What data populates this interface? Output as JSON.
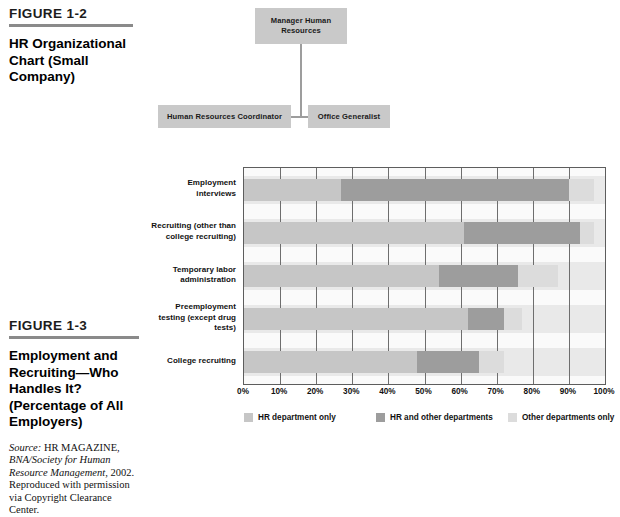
{
  "figure_1_2": {
    "label": "FIGURE 1-2",
    "title": "HR Organizational Chart (Small Company)",
    "org_chart": {
      "top": "Manager Human Resources",
      "left": "Human Resources Coordinator",
      "right": "Office Generalist"
    }
  },
  "figure_1_3": {
    "label": "FIGURE 1-3",
    "title": "Employment and Recruiting—Who Handles It? (Percentage of All Employers)",
    "source_prefix": "Source:",
    "source_body": " HR MAGAZINE, BNA/Society for Human Resource Management, 2002. Reproduced with permission via Copyright Clearance Center.",
    "source_italic_part": "BNA/Society for Human Resource Management",
    "chart_data": {
      "type": "bar",
      "orientation": "horizontal",
      "stacked": true,
      "title": "Employment and Recruiting—Who Handles It? (Percentage of All Employers)",
      "xlabel": "",
      "ylabel": "",
      "xlim": [
        0,
        100
      ],
      "grid": true,
      "legend_position": "bottom",
      "xticks": [
        "0%",
        "10%",
        "20%",
        "30%",
        "40%",
        "50%",
        "60%",
        "70%",
        "80%",
        "90%",
        "100%"
      ],
      "xtick_values": [
        0,
        10,
        20,
        30,
        40,
        50,
        60,
        70,
        80,
        90,
        100
      ],
      "categories": [
        "Employment interviews",
        "Recruiting (other than college recruiting)",
        "Temporary labor administration",
        "Preemployment testing (except drug tests)",
        "College recruiting"
      ],
      "series": [
        {
          "name": "HR department only",
          "color": "#c6c6c6",
          "values": [
            27,
            61,
            54,
            62,
            48
          ]
        },
        {
          "name": "HR and other departments",
          "color": "#9d9d9d",
          "values": [
            63,
            32,
            22,
            10,
            17
          ]
        },
        {
          "name": "Other departments only",
          "color": "#dcdcdc",
          "values": [
            7,
            4,
            11,
            5,
            7
          ]
        }
      ],
      "totals": [
        97,
        97,
        87,
        77,
        72
      ]
    }
  }
}
